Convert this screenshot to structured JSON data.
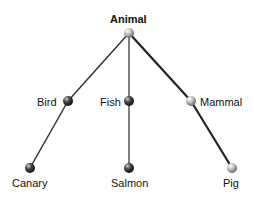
{
  "diagram": {
    "type": "tree",
    "root": {
      "id": "animal",
      "label": "Animal"
    },
    "nodes": [
      {
        "id": "animal",
        "label": "Animal",
        "x": 129,
        "y": 33,
        "shade": "light"
      },
      {
        "id": "bird",
        "label": "Bird",
        "x": 68,
        "y": 101,
        "shade": "dark"
      },
      {
        "id": "fish",
        "label": "Fish",
        "x": 129,
        "y": 101,
        "shade": "dark"
      },
      {
        "id": "mammal",
        "label": "Mammal",
        "x": 191,
        "y": 101,
        "shade": "light"
      },
      {
        "id": "canary",
        "label": "Canary",
        "x": 30,
        "y": 168,
        "shade": "dark"
      },
      {
        "id": "salmon",
        "label": "Salmon",
        "x": 129,
        "y": 168,
        "shade": "dark"
      },
      {
        "id": "pig",
        "label": "Pig",
        "x": 232,
        "y": 168,
        "shade": "light"
      }
    ],
    "edges": [
      {
        "from": "animal",
        "to": "bird"
      },
      {
        "from": "animal",
        "to": "fish"
      },
      {
        "from": "animal",
        "to": "mammal"
      },
      {
        "from": "bird",
        "to": "canary"
      },
      {
        "from": "fish",
        "to": "salmon"
      },
      {
        "from": "mammal",
        "to": "pig"
      }
    ]
  },
  "labels": {
    "animal": "Animal",
    "bird": "Bird",
    "fish": "Fish",
    "mammal": "Mammal",
    "canary": "Canary",
    "salmon": "Salmon",
    "pig": "Pig"
  }
}
